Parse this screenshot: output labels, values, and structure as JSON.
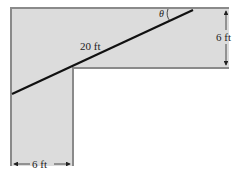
{
  "diagram": {
    "colors": {
      "hallway_fill": "#dcdcdc",
      "wall_stroke": "#8a8a8a",
      "ladder": "#111111",
      "background": "#ffffff"
    },
    "labels": {
      "ladder_length": "20 ft",
      "angle": "θ",
      "right_hallway_width": "6 ft",
      "bottom_hallway_width": "6 ft"
    }
  }
}
